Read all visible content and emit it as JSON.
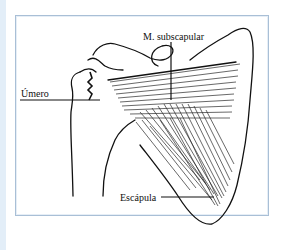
{
  "figure": {
    "labels": {
      "muscle": "M. subscapular",
      "humerus": "Úmero",
      "scapula": "Escápula"
    },
    "colors": {
      "frame_border": "#a9bfd6",
      "left_strip": "#e3eef8",
      "ink": "#111111"
    }
  }
}
